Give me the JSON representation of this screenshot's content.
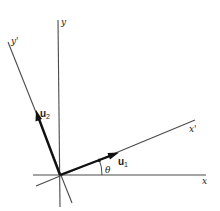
{
  "diagram": {
    "axes": {
      "x": {
        "label": "x",
        "from": [
          33,
          175
        ],
        "to": [
          206,
          175
        ]
      },
      "y": {
        "label": "y",
        "from": [
          60,
          207
        ],
        "to": [
          58,
          20
        ]
      },
      "x_prime": {
        "label": "x'",
        "from": [
          36,
          186
        ],
        "to": [
          195,
          120
        ]
      },
      "y_prime": {
        "label": "y'",
        "from": [
          72,
          203
        ],
        "to": [
          8,
          42
        ]
      }
    },
    "origin": [
      60,
      175
    ],
    "vectors": [
      {
        "name": "u1",
        "base": "u",
        "subscript": "1",
        "from": [
          60,
          175
        ],
        "to": [
          118,
          153
        ]
      },
      {
        "name": "u2",
        "base": "u",
        "subscript": "2",
        "from": [
          60,
          175
        ],
        "to": [
          36,
          111
        ]
      }
    ],
    "angle": {
      "label": "θ",
      "between": [
        "x",
        "x'"
      ]
    },
    "colors": {
      "axis": "#4a4a4a",
      "vector": "#111111",
      "background": "#ffffff"
    }
  }
}
